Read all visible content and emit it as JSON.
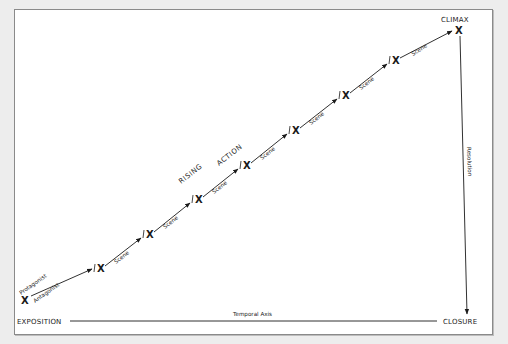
{
  "diagram": {
    "type": "plot-structure",
    "labels": {
      "start": "EXPOSITION",
      "peak": "CLIMAX",
      "end": "CLOSURE",
      "axis": "Temporal Axis",
      "falling": "Resolution",
      "rising_1": "RISING",
      "rising_2": "ACTION",
      "protagonist": "Protagonist",
      "antagonist": "Antagonist",
      "scene": "Scene",
      "mark": "X"
    },
    "scenes": [
      {
        "label": "Scene"
      },
      {
        "label": "Scene"
      },
      {
        "label": "Scene"
      },
      {
        "label": "Scene"
      },
      {
        "label": "Scene"
      },
      {
        "label": "Scene"
      },
      {
        "label": "Scene"
      }
    ],
    "colors": {
      "line": "#1a1a1a",
      "frame": "#8a8a8a",
      "background": "#ededed"
    }
  }
}
